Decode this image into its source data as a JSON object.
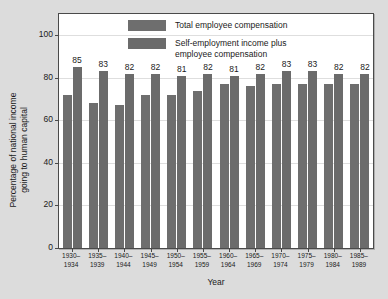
{
  "chart_data": {
    "type": "bar",
    "title": "",
    "xlabel": "Year",
    "ylabel": "Percentage of national income going to human capital",
    "ylabel_line1": "Percentage of national income",
    "ylabel_line2": "going to human capital",
    "ylim": [
      0,
      110
    ],
    "yticks": [
      0,
      20,
      40,
      60,
      80,
      100
    ],
    "grid": true,
    "legend_position": "top-center",
    "categories": [
      "1930–1934",
      "1935–1939",
      "1940–1944",
      "1945–1949",
      "1950–1954",
      "1955–1959",
      "1960–1964",
      "1965–1969",
      "1970–1974",
      "1975–1979",
      "1980–1984",
      "1985–1989"
    ],
    "categories_split": [
      [
        "1930–",
        "1934"
      ],
      [
        "1935–",
        "1939"
      ],
      [
        "1940–",
        "1944"
      ],
      [
        "1945–",
        "1949"
      ],
      [
        "1950–",
        "1954"
      ],
      [
        "1955–",
        "1959"
      ],
      [
        "1960–",
        "1964"
      ],
      [
        "1965–",
        "1969"
      ],
      [
        "1970–",
        "1974"
      ],
      [
        "1975–",
        "1979"
      ],
      [
        "1980–",
        "1984"
      ],
      [
        "1985–",
        "1989"
      ]
    ],
    "series": [
      {
        "name": "Total employee compensation",
        "color": "#6e6e6e",
        "values": [
          72,
          68,
          67,
          72,
          72,
          74,
          77,
          76,
          77,
          77,
          77,
          77
        ],
        "labels_shown": false
      },
      {
        "name": "Self-employment income plus employee compensation",
        "color": "#6b6b6b",
        "values": [
          85,
          83,
          82,
          82,
          81,
          82,
          81,
          82,
          83,
          83,
          82,
          82
        ],
        "labels_shown": true,
        "labels": [
          "85",
          "83",
          "82",
          "82",
          "81",
          "82",
          "81",
          "82",
          "83",
          "83",
          "82",
          "82"
        ]
      }
    ]
  },
  "legend": {
    "items": [
      {
        "label": "Total employee compensation"
      },
      {
        "label": "Self-employment income plus employee compensation"
      }
    ],
    "item2_line1": "Self-employment income plus",
    "item2_line2": "employee compensation"
  },
  "colors": {
    "background": "#dcdcdc",
    "plot_background": "#ffffff",
    "frame": "#4a4a4a",
    "bar_series_1": "#6e6e6e",
    "bar_series_2": "#6b6b6b",
    "text": "#1a1a1a",
    "gridline": "#dedede"
  }
}
